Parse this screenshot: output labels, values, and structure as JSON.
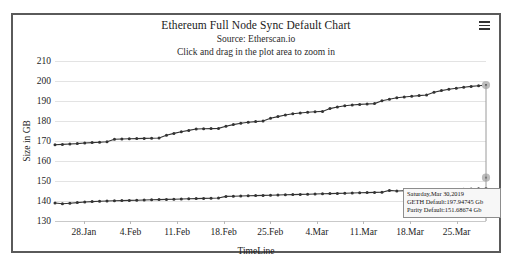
{
  "header": {
    "title": "Ethereum Full Node Sync Default Chart",
    "subtitle": "Source: Etherscan.io",
    "hint": "Click and drag in the plot area to zoom in",
    "menu_icon": "hamburger-menu-icon"
  },
  "tooltip": {
    "date": "Saturday,Mar 30,2019",
    "geth": "GETH Default:197.94745 Gb",
    "parity": "Parity Default:151.68674 Gb"
  },
  "chart_data": {
    "type": "line",
    "title": "Ethereum Full Node Sync Default Chart",
    "subtitle": "Source: Etherscan.io",
    "xlabel": "TimeLine",
    "ylabel": "Size in GB",
    "ylim": [
      130,
      210
    ],
    "yticks": [
      130,
      140,
      150,
      160,
      170,
      180,
      190,
      200,
      210
    ],
    "xticks": [
      "28.Jan",
      "4.Feb",
      "11.Feb",
      "18.Feb",
      "25.Feb",
      "4.Mar",
      "11.Mar",
      "18.Mar",
      "25.Mar"
    ],
    "grid": true,
    "legend": "none",
    "marker": "circle",
    "line_color": "#333333",
    "series": [
      {
        "name": "GETH Default",
        "values": [
          168.1,
          168.3,
          168.5,
          168.7,
          169.0,
          169.2,
          169.4,
          169.6,
          170.9,
          171.0,
          171.1,
          171.2,
          171.3,
          171.4,
          171.5,
          172.9,
          173.8,
          174.6,
          175.3,
          176.0,
          176.1,
          176.2,
          176.3,
          177.4,
          178.2,
          178.9,
          179.4,
          179.7,
          180.0,
          181.4,
          182.2,
          183.0,
          183.6,
          184.0,
          184.4,
          184.6,
          184.8,
          186.2,
          187.0,
          187.6,
          188.0,
          188.3,
          188.5,
          188.7,
          190.1,
          190.9,
          191.6,
          192.0,
          192.4,
          192.7,
          193.0,
          194.4,
          195.2,
          195.9,
          196.4,
          196.9,
          197.3,
          197.6,
          197.94745
        ]
      },
      {
        "name": "Parity Default",
        "values": [
          139.0,
          138.6,
          138.9,
          139.2,
          139.5,
          139.7,
          139.9,
          140.0,
          140.1,
          140.2,
          140.3,
          140.4,
          140.5,
          140.6,
          140.7,
          140.8,
          140.9,
          141.0,
          141.1,
          141.2,
          141.3,
          141.4,
          141.5,
          142.3,
          142.4,
          142.5,
          142.6,
          142.7,
          142.8,
          142.9,
          143.0,
          143.1,
          143.2,
          143.3,
          143.4,
          143.5,
          143.6,
          143.7,
          143.8,
          143.9,
          144.0,
          144.1,
          144.2,
          144.3,
          144.4,
          145.3,
          145.0,
          145.1,
          145.2,
          145.3,
          145.4,
          145.5,
          145.6,
          145.7,
          145.8,
          145.9,
          146.0,
          146.1,
          146.2
        ]
      }
    ],
    "highlight_point": {
      "x_index": 58,
      "geth_value": 197.94745,
      "parity_value": 151.68674
    }
  }
}
